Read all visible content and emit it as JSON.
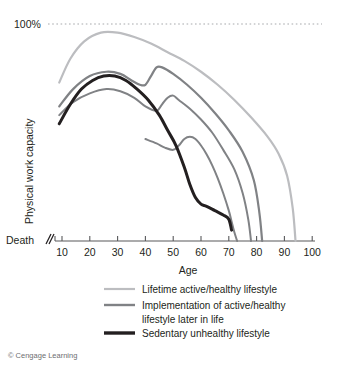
{
  "figure": {
    "credit": "© Cengage Learning"
  },
  "chart_data": {
    "type": "line",
    "title": "",
    "xlabel": "Age",
    "ylabel": "Physical work capacity",
    "xlim": [
      5,
      100
    ],
    "ylim": [
      0,
      100
    ],
    "xticks": [
      10,
      20,
      30,
      40,
      50,
      60,
      70,
      80,
      90,
      100
    ],
    "xticklabels": [
      "10",
      "20",
      "30",
      "40",
      "50",
      "60",
      "70",
      "80",
      "90",
      "100"
    ],
    "yticks": [
      0,
      100
    ],
    "yticklabels": [
      "Death",
      "100%"
    ],
    "y_top_label": "100%",
    "y_bottom_label": "Death",
    "grid": false,
    "top_reference_line": {
      "value": 100,
      "label": "100%",
      "style": "dotted",
      "color": "#999999"
    },
    "axis_break_marker": "//",
    "legend_position": "below",
    "colors": {
      "lifetime_active": "#bcbdc0",
      "implementation": "#808285",
      "sedentary": "#231f20",
      "axis": "#58595b",
      "dotted": "#a7a9ac"
    },
    "series": [
      {
        "name": "Lifetime active/healthy lifestyle",
        "legend_label": "Lifetime active/healthy lifestyle",
        "color": "#bcbdc0",
        "width": 2.2,
        "x": [
          9,
          13,
          18,
          24,
          30,
          36,
          42,
          48,
          54,
          60,
          66,
          72,
          78,
          84,
          88,
          91,
          93,
          94
        ],
        "y": [
          73,
          84,
          92,
          96,
          96,
          94,
          91,
          87,
          83,
          78,
          72,
          65,
          57,
          48,
          40,
          30,
          15,
          0
        ]
      },
      {
        "name": "Implementation of active/healthy lifestyle later in life (mid-life start)",
        "legend_label": "Implementation of active/healthy lifestyle later in life",
        "color": "#808285",
        "width": 2.2,
        "x": [
          9,
          14,
          20,
          26,
          31,
          35,
          38,
          40,
          42,
          44,
          46,
          50,
          55,
          60,
          65,
          70,
          75,
          79,
          81,
          82
        ],
        "y": [
          62,
          70,
          76,
          78,
          77,
          74,
          72,
          72,
          76,
          80,
          80,
          77,
          72,
          66,
          59,
          51,
          41,
          28,
          13,
          0
        ]
      },
      {
        "name": "Implementation of active/healthy lifestyle later in life (later start)",
        "legend_label": "Implementation of active/healthy lifestyle later in life",
        "color": "#808285",
        "width": 2.0,
        "x": [
          9,
          14,
          20,
          26,
          31,
          36,
          40,
          44,
          46,
          48,
          50,
          52,
          56,
          60,
          64,
          68,
          72,
          75,
          77,
          78
        ],
        "y": [
          58,
          64,
          68,
          70,
          69,
          66,
          62,
          60,
          63,
          66,
          67,
          65,
          61,
          56,
          50,
          42,
          33,
          22,
          10,
          0
        ]
      },
      {
        "name": "Implementation of active/healthy lifestyle later in life (latest start)",
        "legend_label": "Implementation of active/healthy lifestyle later in life",
        "color": "#808285",
        "width": 2.0,
        "x": [
          40,
          44,
          47,
          50,
          52,
          54,
          56,
          58,
          60,
          62,
          64,
          66,
          68,
          70,
          71,
          72,
          73
        ],
        "y": [
          47,
          45,
          43,
          42,
          44,
          47,
          48,
          47,
          44,
          40,
          35,
          29,
          22,
          14,
          9,
          4,
          0
        ]
      },
      {
        "name": "Sedentary unhealthy lifestyle",
        "legend_label": "Sedentary unhealthy lifestyle",
        "color": "#231f20",
        "width": 3.0,
        "x": [
          9,
          13,
          17,
          21,
          25,
          29,
          33,
          37,
          41,
          45,
          48,
          51,
          54,
          56,
          58,
          60,
          62,
          65,
          68,
          70,
          71
        ],
        "y": [
          54,
          63,
          70,
          74,
          76,
          76,
          74,
          70,
          65,
          58,
          51,
          44,
          34,
          26,
          20,
          17,
          16,
          14,
          12,
          10,
          5
        ]
      }
    ],
    "legend": [
      {
        "label": "Lifetime active/healthy lifestyle",
        "color": "#bcbdc0",
        "width": 2.2
      },
      {
        "label": "Implementation of active/healthy",
        "color": "#808285",
        "width": 2.4
      },
      {
        "label": "lifestyle later in life",
        "color": null,
        "width": 0
      },
      {
        "label": "Sedentary unhealthy lifestyle",
        "color": "#231f20",
        "width": 3.4
      }
    ]
  }
}
